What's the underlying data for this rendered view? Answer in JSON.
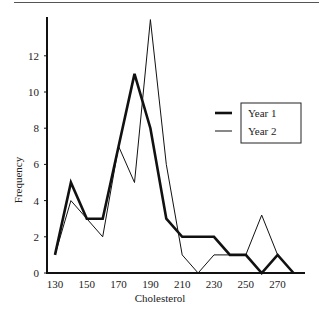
{
  "chart_data": {
    "type": "line",
    "title": "",
    "xlabel": "Cholesterol",
    "ylabel": "Frequency",
    "x": [
      130,
      140,
      150,
      160,
      170,
      180,
      190,
      200,
      210,
      220,
      230,
      240,
      250,
      260,
      270,
      280
    ],
    "x_tick_labels": [
      "130",
      "150",
      "170",
      "190",
      "210",
      "230",
      "250",
      "270"
    ],
    "y_tick_labels": [
      "0",
      "2",
      "4",
      "6",
      "8",
      "10",
      "12"
    ],
    "ylim": [
      0,
      14
    ],
    "grid": false,
    "legend_position": "right-center",
    "series": [
      {
        "name": "Year 1",
        "style": "thick",
        "values": [
          1,
          5,
          3,
          3,
          7,
          11,
          8,
          3,
          2,
          2,
          2,
          1,
          1,
          0,
          1,
          0
        ]
      },
      {
        "name": "Year 2",
        "style": "thin",
        "values": [
          1,
          4,
          3,
          2,
          7,
          5,
          14,
          6,
          1,
          0,
          1,
          1,
          1,
          3.2,
          1,
          0
        ]
      }
    ]
  },
  "legend": {
    "items": [
      "Year 1",
      "Year 2"
    ]
  }
}
